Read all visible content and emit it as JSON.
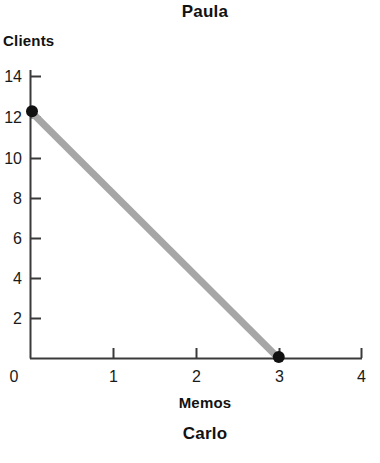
{
  "chart_data": {
    "type": "line",
    "title": "Paula",
    "subtitle": "Carlo",
    "xlabel": "Memos",
    "ylabel": "Clients",
    "xlim": [
      0,
      4
    ],
    "ylim": [
      0,
      14
    ],
    "xticks": [
      "0",
      "1",
      "2",
      "3",
      "4"
    ],
    "yticks": [
      "0",
      "2",
      "4",
      "6",
      "8",
      "10",
      "12",
      "14"
    ],
    "grid": false,
    "legend": "none",
    "series": [
      {
        "name": "Paula's production possibilities frontier",
        "x": [
          0,
          3
        ],
        "y": [
          12,
          0
        ],
        "line_color": "#a6a6a6",
        "marker_color": "#111111",
        "points": [
          {
            "x": 0,
            "y": 12,
            "label": "(0, 12)"
          },
          {
            "x": 3,
            "y": 0,
            "label": "(3, 0)"
          }
        ]
      }
    ],
    "annotations": []
  },
  "colors": {
    "background": "#ffffff",
    "axis": "#3a3a3a",
    "line": "#a6a6a6",
    "marker": "#111111",
    "text": "#121212"
  }
}
